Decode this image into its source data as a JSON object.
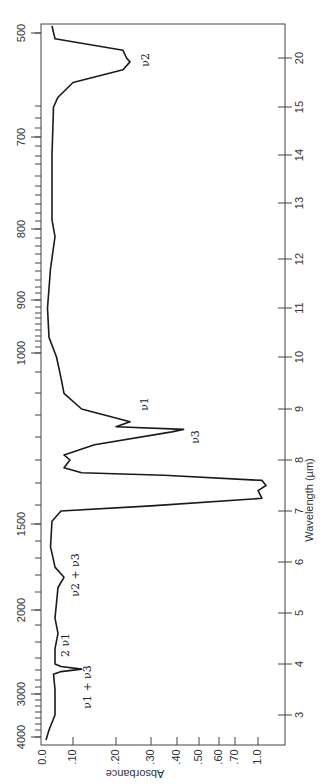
{
  "chart_data": {
    "type": "line",
    "title": "",
    "orientation": "rotated 90° (spectrum runs top-to-bottom, absorbance increases to the right)",
    "xlabel": "Wavelength (µm)",
    "ylabel": "Absorbance",
    "secondary_axis_label": "",
    "wavelength_ticks": [
      "3",
      "4",
      "5",
      "6",
      "7",
      "8",
      "9",
      "10",
      "11",
      "12",
      "13",
      "14",
      "15",
      "20"
    ],
    "wavenumber_ticks": [
      "4000",
      "3000",
      "2000",
      "1500",
      "1000",
      "900",
      "800",
      "700",
      "500"
    ],
    "absorbance_ticks": [
      "0.0",
      ".10",
      ".20",
      ".30",
      ".40",
      ".50",
      ".60",
      ".70",
      "1.0"
    ],
    "xlim_um": [
      2.5,
      22.5
    ],
    "ylim_absorbance": [
      0.0,
      1.3
    ],
    "grid": false,
    "annotations": [
      {
        "text": "ν2",
        "wavelength_um": 20.0,
        "absorbance": 0.24
      },
      {
        "text": "ν1",
        "wavelength_um": 9.2,
        "absorbance": 0.25
      },
      {
        "text": "ν3",
        "wavelength_um": 8.6,
        "absorbance": 0.41
      },
      {
        "text": "ν2 + ν3",
        "wavelength_um": 5.7,
        "absorbance": 0.09
      },
      {
        "text": "2 ν1",
        "wavelength_um": 4.4,
        "absorbance": 0.07
      },
      {
        "text": "ν1 + ν3",
        "wavelength_um": 3.9,
        "absorbance": 0.11
      }
    ],
    "series": [
      {
        "name": "Absorbance spectrum",
        "x_wavelength_um": [
          2.5,
          2.7,
          3.0,
          3.5,
          3.8,
          3.85,
          3.9,
          3.95,
          4.0,
          4.3,
          4.6,
          4.9,
          5.2,
          5.5,
          5.7,
          5.9,
          6.3,
          6.8,
          7.0,
          7.1,
          7.25,
          7.4,
          7.5,
          7.6,
          7.7,
          7.75,
          7.85,
          8.0,
          8.1,
          8.3,
          8.55,
          8.6,
          8.65,
          8.75,
          9.0,
          9.3,
          9.6,
          10.0,
          10.4,
          11.0,
          11.8,
          12.4,
          12.7,
          13.0,
          14.0,
          15.0,
          16.0,
          17.5,
          18.8,
          19.6,
          20.0,
          20.6,
          21.5,
          22.5
        ],
        "absorbance": [
          0.01,
          0.02,
          0.04,
          0.04,
          0.035,
          0.06,
          0.12,
          0.06,
          0.04,
          0.04,
          0.05,
          0.04,
          0.045,
          0.05,
          0.07,
          0.04,
          0.025,
          0.03,
          0.06,
          0.3,
          1.05,
          1.0,
          1.1,
          1.05,
          0.35,
          0.12,
          0.07,
          0.09,
          0.07,
          0.15,
          0.38,
          0.43,
          0.2,
          0.24,
          0.12,
          0.07,
          0.06,
          0.045,
          0.02,
          0.015,
          0.025,
          0.04,
          0.03,
          0.03,
          0.03,
          0.035,
          0.05,
          0.1,
          0.22,
          0.24,
          0.23,
          0.22,
          0.04,
          0.03
        ]
      }
    ]
  }
}
